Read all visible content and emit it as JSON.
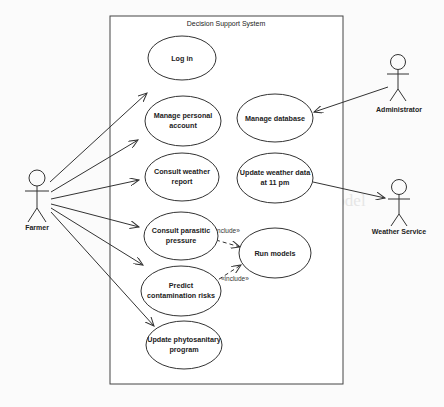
{
  "diagram": {
    "type": "uml-use-case",
    "system": {
      "title": "Decision Support System"
    },
    "actors": [
      {
        "id": "farmer",
        "label": "Farmer"
      },
      {
        "id": "administrator",
        "label": "Administrator"
      },
      {
        "id": "weather_service",
        "label": "Weather Service"
      }
    ],
    "use_cases": [
      {
        "id": "login",
        "lines": [
          "Log in"
        ]
      },
      {
        "id": "manage_account",
        "lines": [
          "Manage personal",
          "account"
        ]
      },
      {
        "id": "consult_weather",
        "lines": [
          "Consult weather",
          "report"
        ]
      },
      {
        "id": "consult_parasitic",
        "lines": [
          "Consult parasitic",
          "pressure"
        ]
      },
      {
        "id": "predict_risks",
        "lines": [
          "Predict",
          "contamination risks"
        ]
      },
      {
        "id": "update_program",
        "lines": [
          "Update phytosanitary",
          "program"
        ]
      },
      {
        "id": "manage_db",
        "lines": [
          "Manage database"
        ]
      },
      {
        "id": "update_weather",
        "lines": [
          "Update weather data",
          "at 11 pm"
        ]
      },
      {
        "id": "run_models",
        "lines": [
          "Run models"
        ]
      }
    ],
    "relations": [
      {
        "from": "farmer",
        "to": "login",
        "kind": "association"
      },
      {
        "from": "farmer",
        "to": "manage_account",
        "kind": "association"
      },
      {
        "from": "farmer",
        "to": "consult_weather",
        "kind": "association"
      },
      {
        "from": "farmer",
        "to": "consult_parasitic",
        "kind": "association"
      },
      {
        "from": "farmer",
        "to": "predict_risks",
        "kind": "association"
      },
      {
        "from": "farmer",
        "to": "update_program",
        "kind": "association"
      },
      {
        "from": "administrator",
        "to": "manage_db",
        "kind": "association"
      },
      {
        "from": "update_weather",
        "to": "weather_service",
        "kind": "association"
      },
      {
        "from": "consult_parasitic",
        "to": "run_models",
        "kind": "include",
        "label": "«include»"
      },
      {
        "from": "predict_risks",
        "to": "run_models",
        "kind": "include",
        "label": "«include»"
      }
    ]
  },
  "background": {
    "heading": "Design of the Scientific Model"
  }
}
